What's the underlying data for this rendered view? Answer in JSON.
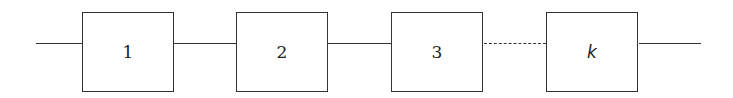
{
  "diagram": {
    "type": "series-system",
    "blocks": [
      {
        "label": "1"
      },
      {
        "label": "2"
      },
      {
        "label": "3"
      },
      {
        "label": "k"
      }
    ],
    "connectors": [
      "solid",
      "solid",
      "solid",
      "dashed",
      "solid"
    ],
    "colors": {
      "line": "#333333",
      "background": "#ffffff"
    }
  }
}
